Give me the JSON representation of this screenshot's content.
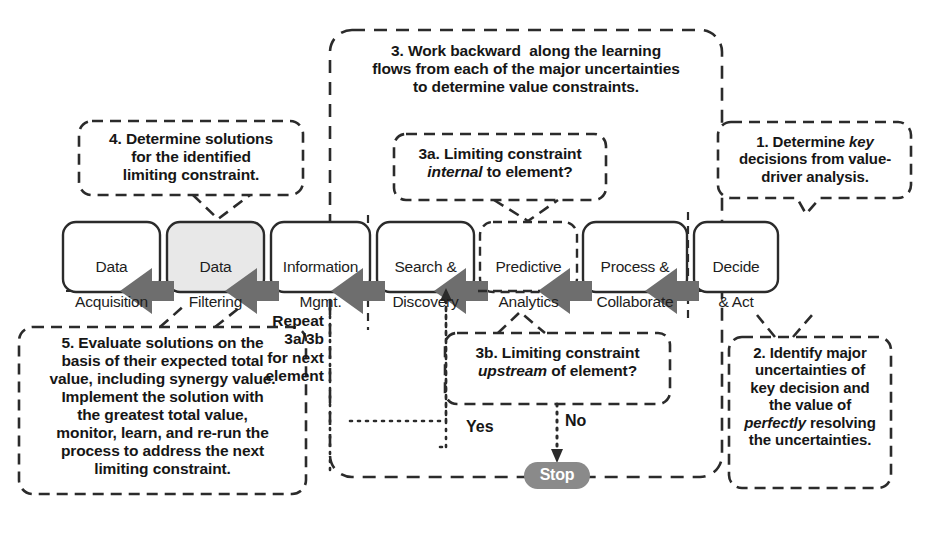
{
  "diagram": {
    "colors": {
      "line": "#2b2b2b",
      "arrow_fill": "#6e6e6e",
      "box_stroke": "#2b2b2b",
      "box_fill": "#ffffff",
      "highlight_fill": "#e8e8e8",
      "stop_fill": "#8a8a8a",
      "stop_text": "#ffffff",
      "background": "#ffffff"
    },
    "process_chain": {
      "name": "information-value-chain",
      "direction": "right-to-left arrows",
      "elements": [
        {
          "id": "data-acquisition",
          "line1": "Data",
          "line2": "Acquisition",
          "highlighted": false,
          "dashed_border": false
        },
        {
          "id": "data-filtering",
          "line1": "Data",
          "line2": "Filtering",
          "highlighted": true,
          "dashed_border": false
        },
        {
          "id": "information-mgmt",
          "line1": "Information",
          "line2": "Mgmt.",
          "highlighted": false,
          "dashed_border": false
        },
        {
          "id": "search-discovery",
          "line1": "Search &",
          "line2": "Discovery",
          "highlighted": false,
          "dashed_border": false
        },
        {
          "id": "predictive-analytics",
          "line1": "Predictive",
          "line2": "Analytics",
          "highlighted": false,
          "dashed_border": true
        },
        {
          "id": "process-collaborate",
          "line1": "Process &",
          "line2": "Collaborate",
          "highlighted": false,
          "dashed_border": false
        },
        {
          "id": "decide-act",
          "line1": "Decide",
          "line2": "& Act",
          "highlighted": false,
          "dashed_border": false
        }
      ]
    },
    "callouts": {
      "step1": {
        "id": "callout-step-1",
        "text_html": "1. Determine <em>key</em><br>decisions from value-<br>driver analysis.",
        "plain": "1. Determine key decisions from value-driver analysis."
      },
      "step2": {
        "id": "callout-step-2",
        "text_html": "2. Identify major<br>uncertainties of<br>key decision and<br>the value of<br><em>perfectly</em> resolving<br>the uncertainties.",
        "plain": "2. Identify major uncertainties of key decision and the value of perfectly resolving the uncertainties."
      },
      "step3": {
        "id": "callout-step-3",
        "text_html": "3. Work backward&nbsp; along the learning<br>flows from each of the major uncertainties<br>to determine value constraints.",
        "plain": "3. Work backward along the learning flows from each of the major uncertainties to determine value constraints."
      },
      "step3a": {
        "id": "callout-step-3a",
        "text_html": "3a. Limiting constraint<br><em>internal</em> to element?",
        "plain": "3a. Limiting constraint internal to element?"
      },
      "step3b": {
        "id": "callout-step-3b",
        "text_html": "3b. Limiting constraint<br><em>upstream</em> of element?",
        "plain": "3b. Limiting constraint upstream of element?"
      },
      "step4": {
        "id": "callout-step-4",
        "text_html": "4. Determine solutions<br>for the identified<br>limiting constraint.",
        "plain": "4. Determine solutions for the identified limiting constraint."
      },
      "step5": {
        "id": "callout-step-5",
        "text_html": "5. Evaluate solutions on the<br>basis of their expected total<br>value, including synergy value.<br>Implement the solution with<br>the greatest total value,<br>monitor, learn, and re-run the<br>process to address the next<br>limiting constraint.",
        "plain": "5. Evaluate solutions on the basis of their expected total value, including synergy value. Implement the solution with the greatest total value, monitor, learn, and re-run the process to address the next limiting constraint."
      }
    },
    "annotations": {
      "repeat_note": "Repeat 3a/3b\nfor next\nelement",
      "yes_label": "Yes",
      "no_label": "No",
      "stop_label": "Stop"
    }
  }
}
